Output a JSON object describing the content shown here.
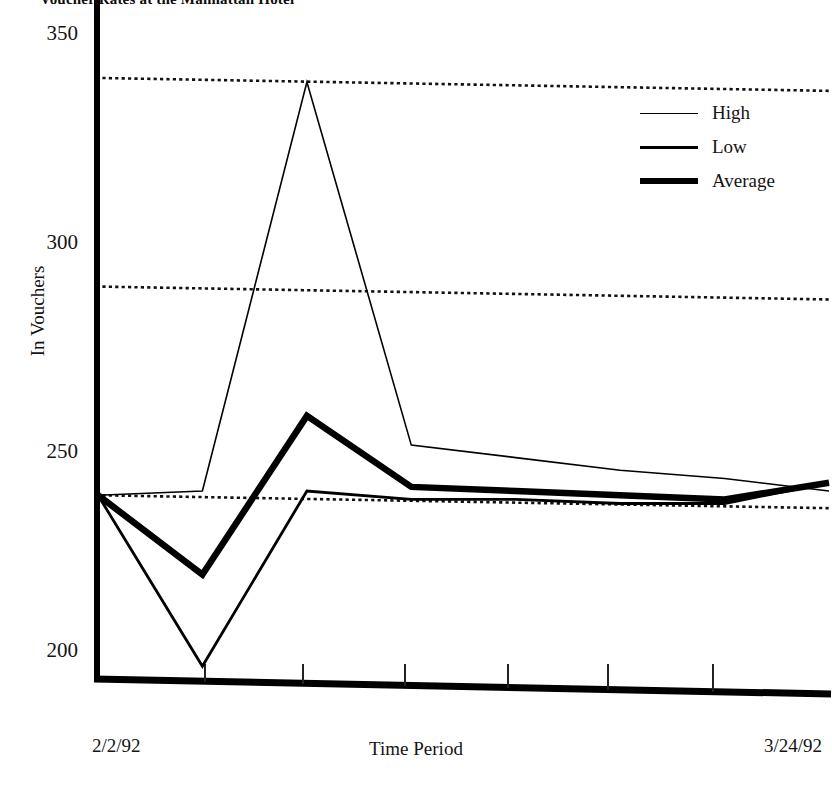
{
  "title": "Voucher Rates at the Manhattan Hotel",
  "axes": {
    "y_title": "In Vouchers",
    "x_title": "Time Period",
    "y_ticks": [
      "350",
      "300",
      "250",
      "200"
    ],
    "x_start_label": "2/2/92",
    "x_end_label": "3/24/92"
  },
  "legend": {
    "position": "top-right",
    "items": [
      {
        "label": "High",
        "weight": "thin"
      },
      {
        "label": "Low",
        "weight": "medium"
      },
      {
        "label": "Average",
        "weight": "thick"
      }
    ]
  },
  "colors": {
    "ink": "#000000",
    "background": "#ffffff",
    "gridline": "#111111"
  },
  "chart_data": {
    "type": "line",
    "title": "Voucher Rates at the Manhattan Hotel",
    "xlabel": "Time Period",
    "ylabel": "In Vouchers",
    "ylim": [
      200,
      350
    ],
    "yticks": [
      200,
      250,
      300,
      350
    ],
    "grid": true,
    "grid_style": "dotted",
    "grid_levels": [
      345,
      295,
      245
    ],
    "legend": [
      "High",
      "Low",
      "Average"
    ],
    "x": [
      "2/2/92",
      "2/9/92",
      "2/17/92",
      "2/25/92",
      "3/3/92",
      "3/10/92",
      "3/17/92",
      "3/24/92"
    ],
    "x_tick_labels_shown": [
      "2/2/92",
      "3/24/92"
    ],
    "series": [
      {
        "name": "High",
        "weight": "thin",
        "values": [
          245,
          246,
          344,
          257,
          254,
          251,
          249,
          246
        ]
      },
      {
        "name": "Low",
        "weight": "medium",
        "values": [
          245,
          204,
          246,
          244,
          244,
          243,
          243,
          248
        ]
      },
      {
        "name": "Average",
        "weight": "thick",
        "values": [
          245,
          226,
          264,
          247,
          246,
          245,
          244,
          248
        ]
      }
    ]
  }
}
